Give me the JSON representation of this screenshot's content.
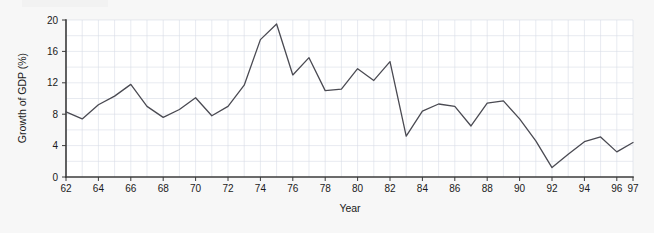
{
  "chart_data": {
    "type": "line",
    "title": "",
    "xlabel": "Year",
    "ylabel": "Growth of GDP (%)",
    "xlim": [
      62,
      97
    ],
    "ylim": [
      0,
      20
    ],
    "grid": true,
    "legend": "none",
    "line_color": "#4a4a52",
    "grid_color": "#d7dce6",
    "axis_color": "#3b3b3b",
    "background_color": "#f7f7f7",
    "plot_background_color": "#ffffff",
    "y_ticks": [
      0,
      4,
      8,
      12,
      16,
      20
    ],
    "y_tick_labels": [
      "0",
      "4",
      "8",
      "12",
      "16",
      "20"
    ],
    "x_ticks": [
      62,
      64,
      66,
      68,
      70,
      72,
      74,
      76,
      78,
      80,
      82,
      84,
      86,
      88,
      90,
      92,
      94,
      96,
      97
    ],
    "x_tick_labels": [
      "62",
      "64",
      "66",
      "68",
      "70",
      "72",
      "74",
      "76",
      "78",
      "80",
      "82",
      "84",
      "86",
      "88",
      "90",
      "92",
      "94",
      "96",
      "97"
    ],
    "x": [
      62,
      63,
      64,
      65,
      66,
      67,
      68,
      69,
      70,
      71,
      72,
      73,
      74,
      75,
      76,
      77,
      78,
      79,
      80,
      81,
      82,
      83,
      84,
      85,
      86,
      87,
      88,
      89,
      90,
      91,
      92,
      93,
      94,
      95,
      96,
      97
    ],
    "values": [
      8.3,
      7.4,
      9.2,
      10.3,
      11.8,
      9.0,
      7.6,
      8.6,
      10.1,
      7.8,
      9.0,
      11.7,
      17.5,
      19.5,
      13.0,
      15.2,
      11.0,
      11.2,
      13.8,
      12.3,
      14.7,
      5.2,
      8.4,
      9.3,
      9.0,
      6.5,
      9.4,
      9.7,
      7.4,
      4.6,
      1.2,
      2.9,
      4.5,
      5.1,
      3.2,
      4.4
    ]
  }
}
